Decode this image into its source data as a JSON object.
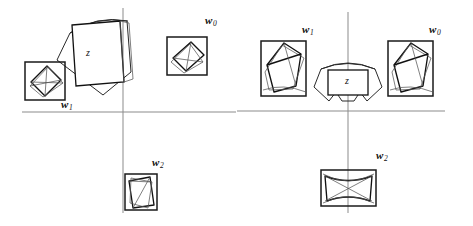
{
  "figure": {
    "title": "",
    "background_color": "#ffffff",
    "axis_color": "#8b8b8b",
    "ink_color": "#111111",
    "panels": [
      {
        "id": "left",
        "name": "before-alignment",
        "origin": {
          "x": 123,
          "y": 112
        },
        "axes": {
          "vertical": {
            "x": 123,
            "y_top": 8,
            "y_bottom": 213
          },
          "horizontal": {
            "y": 112,
            "x_left": 22,
            "x_right": 236
          }
        },
        "z_label": "z",
        "z_label_pos": {
          "x": 86,
          "y": 48
        },
        "items": [
          {
            "label": "w",
            "subscript": "0",
            "label_pos": {
              "x": 205,
              "y": 15
            },
            "box": {
              "x": 167,
              "y": 37,
              "w": 40,
              "h": 38
            }
          },
          {
            "label": "w",
            "subscript": "1",
            "label_pos": {
              "x": 61,
              "y": 99
            },
            "box": {
              "x": 25,
              "y": 62,
              "w": 40,
              "h": 38
            }
          },
          {
            "label": "w",
            "subscript": "2",
            "label_pos": {
              "x": 152,
              "y": 157
            },
            "box": {
              "x": 125,
              "y": 174,
              "w": 32,
              "h": 36
            }
          }
        ]
      },
      {
        "id": "right",
        "name": "after-alignment",
        "origin": {
          "x": 112,
          "y": 111
        },
        "axes": {
          "vertical": {
            "x": 112,
            "y_top": 12,
            "y_bottom": 213
          },
          "horizontal": {
            "y": 111,
            "x_left": 1,
            "x_right": 209
          }
        },
        "z_label": "z",
        "z_label_pos": {
          "x": 109,
          "y": 80
        },
        "items": [
          {
            "label": "w",
            "subscript": "1",
            "label_pos": {
              "x": 66,
              "y": 24
            },
            "box": {
              "x": 25,
              "y": 41,
              "w": 45,
              "h": 55
            }
          },
          {
            "label": "w",
            "subscript": "0",
            "label_pos": {
              "x": 193,
              "y": 24
            },
            "box": {
              "x": 152,
              "y": 41,
              "w": 45,
              "h": 55
            }
          },
          {
            "label": "w",
            "subscript": "2",
            "label_pos": {
              "x": 140,
              "y": 150
            },
            "box": {
              "x": 85,
              "y": 170,
              "w": 55,
              "h": 36
            }
          }
        ]
      }
    ]
  }
}
